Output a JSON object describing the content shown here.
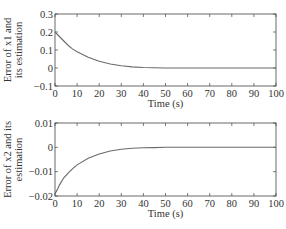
{
  "chart_data": [
    {
      "type": "line",
      "title": "",
      "xlabel": "Time (s)",
      "ylabel_line1": "Error of x1 and",
      "ylabel_line2": "its estimation",
      "xlim": [
        0,
        100
      ],
      "ylim": [
        -0.1,
        0.3
      ],
      "xticks": [
        "0",
        "10",
        "20",
        "30",
        "40",
        "50",
        "60",
        "70",
        "80",
        "90",
        "100"
      ],
      "yticks": [
        "0.3",
        "0.2",
        "0.1",
        "0",
        "-0.1"
      ],
      "ytick_values": [
        0.3,
        0.2,
        0.1,
        0,
        -0.1
      ],
      "grid": false,
      "series": [
        {
          "name": "Error of x1",
          "x": [
            0,
            2,
            4,
            6,
            8,
            10,
            15,
            20,
            25,
            30,
            35,
            40,
            45,
            50,
            60,
            70,
            80,
            90,
            100
          ],
          "values": [
            0.2,
            0.175,
            0.15,
            0.125,
            0.105,
            0.09,
            0.06,
            0.038,
            0.022,
            0.012,
            0.006,
            0.003,
            0.001,
            0,
            0,
            0,
            0,
            0,
            0
          ]
        }
      ]
    },
    {
      "type": "line",
      "title": "",
      "xlabel": "Time (s)",
      "ylabel_line1": "Error of x2 and its",
      "ylabel_line2": "estimation",
      "xlim": [
        0,
        100
      ],
      "ylim": [
        -0.02,
        0.01
      ],
      "xticks": [
        "0",
        "10",
        "20",
        "30",
        "40",
        "50",
        "60",
        "70",
        "80",
        "90",
        "100"
      ],
      "yticks": [
        "0.01",
        "0",
        "-0.01",
        "-0.02"
      ],
      "ytick_values": [
        0.01,
        0,
        -0.01,
        -0.02
      ],
      "grid": false,
      "series": [
        {
          "name": "Error of x2",
          "x": [
            0,
            1,
            2,
            4,
            6,
            8,
            10,
            15,
            20,
            25,
            30,
            35,
            40,
            45,
            50,
            60,
            70,
            80,
            90,
            100
          ],
          "values": [
            -0.019,
            -0.0175,
            -0.0155,
            -0.0125,
            -0.0105,
            -0.0088,
            -0.0072,
            -0.0045,
            -0.0027,
            -0.0015,
            -0.0008,
            -0.0004,
            -0.0002,
            -0.0001,
            0,
            0,
            0,
            0,
            0,
            0
          ]
        }
      ]
    }
  ],
  "colors": {
    "line": "#6a6a6a",
    "axis": "#444444",
    "text": "#333333"
  }
}
